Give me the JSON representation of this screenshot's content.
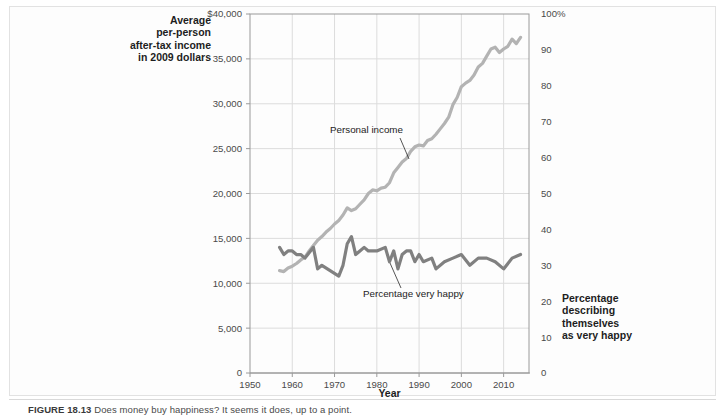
{
  "figure": {
    "caption_label": "FIGURE 18.13",
    "caption_text": "Does money buy happiness? It seems it does, up to a point.",
    "axis_titles": {
      "left": [
        "Average",
        "per-person",
        "after-tax income",
        "in 2009 dollars"
      ],
      "right": [
        "Percentage",
        "describing",
        "themselves",
        "as very happy"
      ],
      "x": "Year"
    },
    "annotations": [
      {
        "name": "personal-income",
        "text": "Personal income"
      },
      {
        "name": "percentage-very-happy",
        "text": "Percentage very happy"
      }
    ]
  },
  "colors": {
    "income_line": "#b3b3b3",
    "happy_line": "#808080",
    "grid": "#dcdcdc",
    "frame": "#9a9a9a",
    "tick_text": "#4a4a4a",
    "page_bg": "#fdfdfd"
  },
  "chart_data": {
    "type": "line",
    "title": "",
    "xlabel": "Year",
    "ylabel": "Average per-person after-tax income in 2009 dollars",
    "y2label": "Percentage describing themselves as very happy",
    "xlim": [
      1950,
      2016
    ],
    "ylim": [
      0,
      40000
    ],
    "y2lim": [
      0,
      100
    ],
    "grid": true,
    "legend": "none (inline annotations)",
    "xticks": [
      1950,
      1960,
      1970,
      1980,
      1990,
      2000,
      2010
    ],
    "xtick_labels": [
      "1950",
      "1960",
      "1970",
      "1980",
      "1990",
      "2000",
      "2010"
    ],
    "yticks": [
      0,
      5000,
      10000,
      15000,
      20000,
      25000,
      30000,
      35000,
      40000
    ],
    "ytick_labels": [
      "0",
      "5,000",
      "10,000",
      "15,000",
      "20,000",
      "25,000",
      "30,000",
      "35,000",
      "$40,000"
    ],
    "y2ticks": [
      0,
      10,
      20,
      30,
      40,
      50,
      60,
      70,
      80,
      90,
      100
    ],
    "y2tick_labels": [
      "0",
      "10",
      "20",
      "30",
      "40",
      "50",
      "60",
      "70",
      "80",
      "90",
      "100%"
    ],
    "series": [
      {
        "name": "Personal income",
        "axis": "left",
        "units": "2009 dollars",
        "color": "#b3b3b3",
        "x": [
          1957,
          1958,
          1959,
          1960,
          1961,
          1962,
          1963,
          1964,
          1965,
          1966,
          1967,
          1968,
          1969,
          1970,
          1971,
          1972,
          1973,
          1974,
          1975,
          1976,
          1977,
          1978,
          1979,
          1980,
          1981,
          1982,
          1983,
          1984,
          1985,
          1986,
          1987,
          1988,
          1989,
          1990,
          1991,
          1992,
          1993,
          1994,
          1995,
          1996,
          1997,
          1998,
          1999,
          2000,
          2001,
          2002,
          2003,
          2004,
          2005,
          2006,
          2007,
          2008,
          2009,
          2010,
          2011,
          2012,
          2013,
          2014
        ],
        "values": [
          11400,
          11300,
          11700,
          11900,
          12200,
          12600,
          12900,
          13600,
          14200,
          14800,
          15200,
          15700,
          16100,
          16600,
          17000,
          17600,
          18400,
          18100,
          18300,
          18800,
          19300,
          20000,
          20400,
          20300,
          20600,
          20700,
          21200,
          22300,
          22900,
          23500,
          23900,
          24700,
          25200,
          25400,
          25300,
          25900,
          26100,
          26600,
          27200,
          27800,
          28500,
          29900,
          30700,
          31900,
          32300,
          32600,
          33200,
          34100,
          34500,
          35300,
          36100,
          36300,
          35700,
          36100,
          36400,
          37200,
          36700,
          37400
        ]
      },
      {
        "name": "Percentage very happy",
        "axis": "right",
        "units": "percent",
        "color": "#808080",
        "x": [
          1957,
          1958,
          1959,
          1960,
          1961,
          1962,
          1963,
          1965,
          1966,
          1967,
          1971,
          1972,
          1973,
          1974,
          1975,
          1976,
          1977,
          1978,
          1980,
          1982,
          1983,
          1984,
          1985,
          1986,
          1987,
          1988,
          1989,
          1990,
          1991,
          1993,
          1994,
          1996,
          1998,
          2000,
          2002,
          2004,
          2006,
          2008,
          2010,
          2012,
          2014
        ],
        "values": [
          35,
          33,
          34,
          34,
          33,
          33,
          32,
          35,
          29,
          30,
          27,
          30,
          36,
          38,
          33,
          34,
          35,
          34,
          34,
          35,
          31,
          34,
          29,
          33,
          34,
          34,
          31,
          33,
          31,
          32,
          29,
          31,
          32,
          33,
          30,
          32,
          32,
          31,
          29,
          32,
          33
        ]
      }
    ]
  }
}
